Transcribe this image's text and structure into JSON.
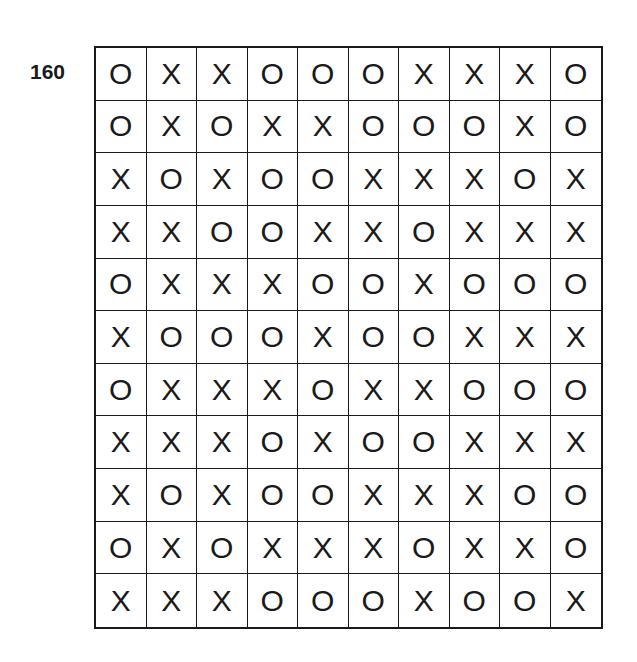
{
  "puzzle": {
    "number": "160",
    "rows": [
      [
        "O",
        "X",
        "X",
        "O",
        "O",
        "O",
        "X",
        "X",
        "X",
        "O"
      ],
      [
        "O",
        "X",
        "O",
        "X",
        "X",
        "O",
        "O",
        "O",
        "X",
        "O"
      ],
      [
        "X",
        "O",
        "X",
        "O",
        "O",
        "X",
        "X",
        "X",
        "O",
        "X"
      ],
      [
        "X",
        "X",
        "O",
        "O",
        "X",
        "X",
        "O",
        "X",
        "X",
        "X"
      ],
      [
        "O",
        "X",
        "X",
        "X",
        "O",
        "O",
        "X",
        "O",
        "O",
        "O"
      ],
      [
        "X",
        "O",
        "O",
        "O",
        "X",
        "O",
        "O",
        "X",
        "X",
        "X"
      ],
      [
        "O",
        "X",
        "X",
        "X",
        "O",
        "X",
        "X",
        "O",
        "O",
        "O"
      ],
      [
        "X",
        "X",
        "X",
        "O",
        "X",
        "O",
        "O",
        "X",
        "X",
        "X"
      ],
      [
        "X",
        "O",
        "X",
        "O",
        "O",
        "X",
        "X",
        "X",
        "O",
        "O"
      ],
      [
        "O",
        "X",
        "O",
        "X",
        "X",
        "X",
        "O",
        "X",
        "X",
        "O"
      ],
      [
        "X",
        "X",
        "X",
        "O",
        "O",
        "O",
        "X",
        "O",
        "O",
        "X"
      ]
    ]
  },
  "colors": {
    "ink": "#1a1a1a",
    "background": "#ffffff"
  }
}
